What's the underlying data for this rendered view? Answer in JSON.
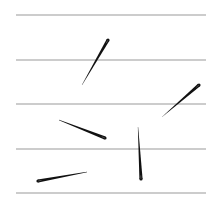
{
  "diagram": {
    "width": 219,
    "height": 208,
    "background": "#ffffff",
    "lines": {
      "color": "#9a9a9a",
      "stroke_width": 1.2,
      "x_start": 16,
      "x_end": 206,
      "y_positions": [
        15,
        60,
        104,
        149,
        193
      ]
    },
    "needles": {
      "color": "#111111",
      "eye_color": "#555555",
      "items": [
        {
          "id": "needle-1",
          "eye": [
            108,
            40
          ],
          "tip": [
            82,
            85
          ]
        },
        {
          "id": "needle-2",
          "eye": [
            199,
            85
          ],
          "tip": [
            162,
            117
          ]
        },
        {
          "id": "needle-3",
          "eye": [
            105,
            138
          ],
          "tip": [
            59,
            120
          ]
        },
        {
          "id": "needle-4",
          "eye": [
            141,
            179
          ],
          "tip": [
            138,
            127
          ]
        },
        {
          "id": "needle-5",
          "eye": [
            38,
            181
          ],
          "tip": [
            87,
            172
          ]
        }
      ]
    }
  }
}
